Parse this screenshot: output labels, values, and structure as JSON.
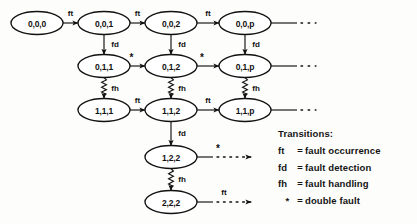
{
  "diagram": {
    "title": "",
    "nodes": [
      {
        "id": "n000",
        "label": "0,0,0",
        "cx": 37,
        "cy": 23
      },
      {
        "id": "n001",
        "label": "0,0,1",
        "cx": 104,
        "cy": 23
      },
      {
        "id": "n002",
        "label": "0,0,2",
        "cx": 171,
        "cy": 23
      },
      {
        "id": "n00p",
        "label": "0,0,p",
        "cx": 245,
        "cy": 23
      },
      {
        "id": "n011",
        "label": "0,1,1",
        "cx": 104,
        "cy": 66
      },
      {
        "id": "n012",
        "label": "0,1,2",
        "cx": 171,
        "cy": 66
      },
      {
        "id": "n01p",
        "label": "0,1,p",
        "cx": 245,
        "cy": 66
      },
      {
        "id": "n111",
        "label": "1,1,1",
        "cx": 104,
        "cy": 110
      },
      {
        "id": "n112",
        "label": "1,1,2",
        "cx": 171,
        "cy": 110
      },
      {
        "id": "n11p",
        "label": "1,1,p",
        "cx": 245,
        "cy": 110
      },
      {
        "id": "n122",
        "label": "1,2,2",
        "cx": 171,
        "cy": 157
      },
      {
        "id": "n222",
        "label": "2,2,2",
        "cx": 171,
        "cy": 202
      }
    ],
    "edges": [
      {
        "from": "n000",
        "to": "n001",
        "label": "ft",
        "style": "solid",
        "dir": "right"
      },
      {
        "from": "n001",
        "to": "n002",
        "label": "ft",
        "style": "solid",
        "dir": "right"
      },
      {
        "from": "n002",
        "to": "n00p",
        "label": "ft",
        "style": "dotted",
        "dir": "right"
      },
      {
        "from": "n00p",
        "to": "",
        "label": "",
        "style": "trail",
        "dir": "right"
      },
      {
        "from": "n001",
        "to": "n011",
        "label": "fd",
        "style": "solid",
        "dir": "down"
      },
      {
        "from": "n002",
        "to": "n012",
        "label": "fd",
        "style": "solid",
        "dir": "down"
      },
      {
        "from": "n00p",
        "to": "n01p",
        "label": "fd",
        "style": "solid",
        "dir": "down"
      },
      {
        "from": "n011",
        "to": "n012",
        "label": "*",
        "style": "solid",
        "dir": "right"
      },
      {
        "from": "n012",
        "to": "n01p",
        "label": "*",
        "style": "dotted",
        "dir": "right"
      },
      {
        "from": "n01p",
        "to": "",
        "label": "",
        "style": "trail",
        "dir": "right"
      },
      {
        "from": "n011",
        "to": "n111",
        "label": "fh",
        "style": "zigzag",
        "dir": "down"
      },
      {
        "from": "n012",
        "to": "n112",
        "label": "fh",
        "style": "zigzag",
        "dir": "down"
      },
      {
        "from": "n01p",
        "to": "n11p",
        "label": "fh",
        "style": "zigzag",
        "dir": "down"
      },
      {
        "from": "n111",
        "to": "n112",
        "label": "ft",
        "style": "solid",
        "dir": "right"
      },
      {
        "from": "n112",
        "to": "n11p",
        "label": "ft",
        "style": "dotted",
        "dir": "right"
      },
      {
        "from": "n11p",
        "to": "",
        "label": "",
        "style": "trail",
        "dir": "right"
      },
      {
        "from": "n112",
        "to": "n122",
        "label": "fd",
        "style": "solid",
        "dir": "down"
      },
      {
        "from": "n122",
        "to": "",
        "label": "*",
        "style": "dotted-open",
        "dir": "right"
      },
      {
        "from": "n122",
        "to": "n222",
        "label": "fh",
        "style": "zigzag",
        "dir": "down"
      },
      {
        "from": "n222",
        "to": "",
        "label": "ft",
        "style": "dotted-open",
        "dir": "right"
      }
    ]
  },
  "legend": {
    "title": "Transitions:",
    "items": [
      {
        "symbol": "ft",
        "equals": "=",
        "description": "fault occurrence"
      },
      {
        "symbol": "fd",
        "equals": "=",
        "description": "fault detection"
      },
      {
        "symbol": "fh",
        "equals": "=",
        "description": "fault handling"
      },
      {
        "symbol": "*",
        "equals": "=",
        "description": "double fault"
      }
    ]
  },
  "colors": {
    "stroke": "#111111",
    "text": "#141414",
    "background": "#fdfdfc"
  }
}
